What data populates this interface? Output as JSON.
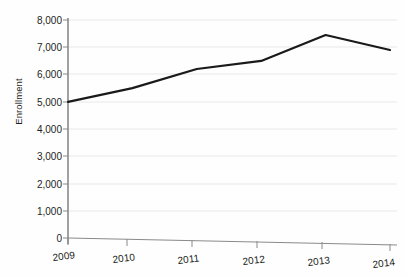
{
  "chart_data": {
    "type": "line",
    "title": "",
    "subtitle": "",
    "xlabel": "",
    "ylabel": "Enrollment",
    "categories": [
      "2009",
      "2010",
      "2011",
      "2012",
      "2013",
      "2014"
    ],
    "x": [
      2009,
      2010,
      2011,
      2012,
      2013,
      2014
    ],
    "values": [
      5000,
      5500,
      6200,
      6500,
      7450,
      6900
    ],
    "series": [
      {
        "name": "Enrollment",
        "values": [
          5000,
          5500,
          6200,
          6500,
          7450,
          6900
        ]
      }
    ],
    "ylim": [
      0,
      8000
    ],
    "yticks": [
      0,
      1000,
      2000,
      3000,
      4000,
      5000,
      6000,
      7000,
      8000
    ],
    "ytick_labels": [
      "0",
      "1,000",
      "2,000",
      "3,000",
      "4,000",
      "5,000",
      "6,000",
      "7,000",
      "8,000"
    ],
    "xtick_labels": [
      "2009",
      "2010",
      "2011",
      "2012",
      "2013",
      "2014"
    ],
    "grid": "horizontal",
    "legend": "none",
    "annotations": [],
    "colors": {
      "line": "#1a1a1a",
      "gridline": "#e8e8e8",
      "axis": "#808080",
      "text": "#231f20",
      "background": "#fefefe"
    }
  }
}
